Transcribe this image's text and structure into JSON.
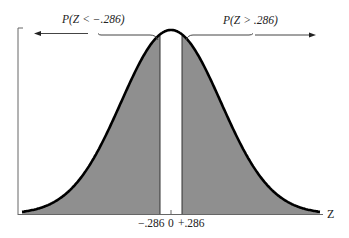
{
  "chart_data": {
    "type": "area",
    "title": "",
    "xlabel": "Z",
    "ylabel": "",
    "distribution": "standard normal",
    "mean": 0,
    "sd": 1,
    "shaded_regions": [
      {
        "name": "left_tail",
        "label": "P(Z < -.286)",
        "from": "-inf",
        "to": -0.286
      },
      {
        "name": "right_tail",
        "label": "P(Z > .286)",
        "from": 0.286,
        "to": "inf"
      }
    ],
    "unshaded_region": {
      "from": -0.286,
      "to": 0.286
    },
    "x_ticks": [
      {
        "value": -0.286,
        "label": "−.286"
      },
      {
        "value": 0,
        "label": "0"
      },
      {
        "value": 0.286,
        "label": "+.286"
      }
    ],
    "grid": false,
    "colors": {
      "shade": "#8f8f8f",
      "curve": "#000000",
      "axis": "#555555"
    }
  },
  "labels": {
    "left_tail": "P(Z < −.286)",
    "right_tail": "P(Z > .286)",
    "axis_z": "Z",
    "tick_neg": "−.286",
    "tick_zero": "0",
    "tick_pos": "+.286"
  }
}
